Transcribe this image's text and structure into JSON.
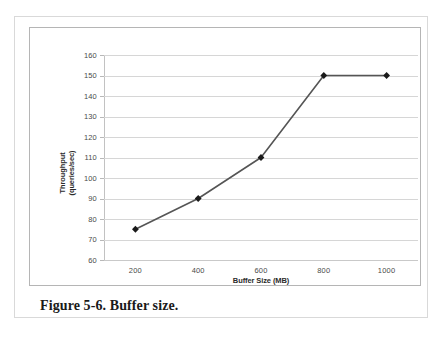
{
  "figure": {
    "caption": "Figure 5-6. Buffer size.",
    "frame_border_color": "#b5b5b5",
    "page_border_color": "#d9d9d9",
    "background": "#ffffff"
  },
  "chart_data": {
    "type": "line",
    "title": "",
    "xlabel": "Buffer Size (MB)",
    "ylabel": "Throughput\n(queries/sec)",
    "ylabel_line1": "Throughput",
    "ylabel_line2": "(queries/sec)",
    "x": [
      200,
      400,
      600,
      800,
      1000
    ],
    "values": [
      75,
      90,
      110,
      150,
      150
    ],
    "series": [
      {
        "name": "Throughput",
        "values": [
          75,
          90,
          110,
          150,
          150
        ],
        "line_color": "#555555",
        "marker": "diamond",
        "marker_color": "#1a1a1a"
      }
    ],
    "xlim": [
      100,
      1100
    ],
    "ylim": [
      60,
      160
    ],
    "xticks": [
      200,
      400,
      600,
      800,
      1000
    ],
    "yticks": [
      60,
      70,
      80,
      90,
      100,
      110,
      120,
      130,
      140,
      150,
      160
    ],
    "xtick_labels": [
      "200",
      "400",
      "600",
      "800",
      "1000"
    ],
    "ytick_labels": [
      "60",
      "70",
      "80",
      "90",
      "100",
      "110",
      "120",
      "130",
      "140",
      "150",
      "160"
    ],
    "grid": true,
    "grid_axis": "y",
    "grid_color": "#d6d6d6",
    "legend": false,
    "legend_position": "none",
    "axis_line_color": "#c2c2c2",
    "tick_label_color": "#4a4a4a",
    "axis_title_color": "#2b2b2b"
  }
}
